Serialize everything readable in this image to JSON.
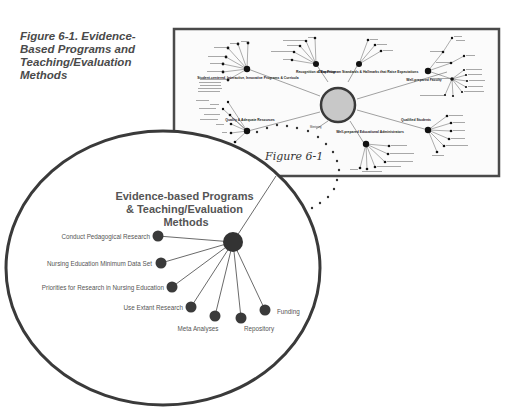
{
  "caption": {
    "text": "Figure 6-1. Evidence-Based Programs and Teaching/Evaluation Methods"
  },
  "figure_reference": "Figure 6-1",
  "colors": {
    "frame": "#4a4a4a",
    "center_fill": "#c8c8c8",
    "node": "#1a1a1a",
    "zoom_node": "#3a3a3a",
    "text": "#555555"
  },
  "overview_diagram": {
    "hubs": [
      {
        "label": "Student-centered, Interactive, Innovative Programs & Curricula"
      },
      {
        "label": "Recognition of Expertise"
      },
      {
        "label": "Clear Program Standards & Hallmarks that Raise Expectations"
      },
      {
        "label": "Well-prepared Faculty"
      },
      {
        "label": "Quality & Adequate Resources"
      },
      {
        "label": "Qualified Students"
      },
      {
        "label": "Well-prepared Educational Administrators"
      }
    ],
    "dotted_link_label": "Mentoring"
  },
  "zoom_diagram": {
    "title_lines": [
      "Evidence-based Programs",
      "& Teaching/Evaluation",
      "Methods"
    ],
    "leaves": [
      {
        "label": "Conduct Pedagogical Research"
      },
      {
        "label": "Nursing Education Minimum Data Set"
      },
      {
        "label": "Priorities for Research in Nursing Education"
      },
      {
        "label": "Use Extant Research"
      },
      {
        "label": "Meta Analyses"
      },
      {
        "label": "Repository"
      },
      {
        "label": "Funding"
      }
    ]
  }
}
